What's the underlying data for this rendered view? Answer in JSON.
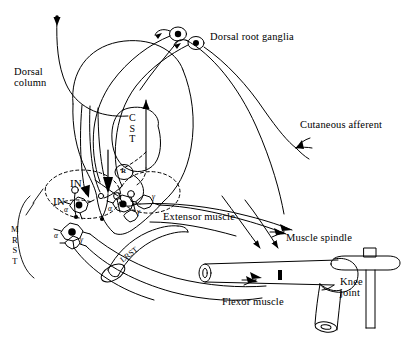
{
  "figure": {
    "background_color": "#ffffff",
    "ink_color": "#000000",
    "width": 413,
    "height": 341
  },
  "labels": {
    "dorsal_column": "Dorsal\ncolumn",
    "dorsal_root_ganglia": "Dorsal root ganglia",
    "cutaneous_afferent": "Cutaneous afferent",
    "extensor_muscle": "Extensor muscle",
    "flexor_muscle": "Flexor muscle",
    "muscle_spindle": "Muscle spindle",
    "knee_joint": "Knee\njoint",
    "cst": "C\nS\nT",
    "renshaw": "R",
    "interneuron_1": "IN",
    "interneuron_2": "IN",
    "mrst": "M\nR\nS\nT",
    "lrst": "LRST",
    "alpha_1": "α",
    "alpha_2": "α",
    "alpha_3": "α",
    "gamma_1": "γ",
    "gamma_2": "γ",
    "gamma_3": "γ"
  },
  "structures": {
    "cord_outline": "spinal-cord-cross-section",
    "ganglion_cells": 2,
    "motor_neurons_alpha": 3,
    "motor_neurons_gamma": 3,
    "interneurons_filled": 2,
    "renshaw_cell": 1,
    "hammer": "reflex-hammer"
  }
}
